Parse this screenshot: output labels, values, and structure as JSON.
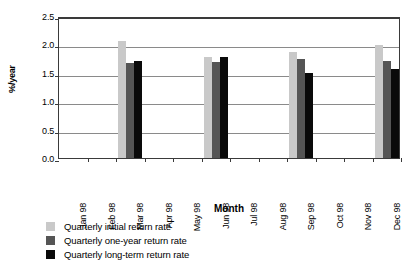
{
  "chart_data": {
    "type": "bar",
    "title": "",
    "xlabel": "Month",
    "ylabel": "%/year",
    "ylim": [
      0.0,
      2.5
    ],
    "ytick_values": [
      0.0,
      0.5,
      1.0,
      1.5,
      2.0,
      2.5
    ],
    "ytick_labels": [
      "0.0",
      "0.5",
      "1.0",
      "1.5",
      "2.0",
      "2.5"
    ],
    "grid": true,
    "legend_position": "below",
    "categories": [
      "Jan 98",
      "Feb 98",
      "Mar 98",
      "Apr 98",
      "May 98",
      "Jun 98",
      "Jul 98",
      "Aug 98",
      "Sep 98",
      "Oct 98",
      "Nov 98",
      "Dec 98"
    ],
    "series": [
      {
        "name": "Quarterly initial return rate",
        "color": "#c9c9c9",
        "values": [
          null,
          null,
          2.06,
          null,
          null,
          1.78,
          null,
          null,
          1.86,
          null,
          null,
          1.99
        ]
      },
      {
        "name": "Quarterly one-year return rate",
        "color": "#555555",
        "values": [
          null,
          null,
          1.67,
          null,
          null,
          1.69,
          null,
          null,
          1.74,
          null,
          null,
          1.7
        ]
      },
      {
        "name": "Quarterly long-term return rate",
        "color": "#0a0a0a",
        "values": [
          null,
          null,
          1.71,
          null,
          null,
          1.77,
          null,
          null,
          1.49,
          null,
          null,
          1.56
        ]
      }
    ]
  },
  "legend": {
    "items": [
      {
        "label": "Quarterly initial return rate",
        "color": "#c9c9c9"
      },
      {
        "label": "Quarterly one-year return rate",
        "color": "#555555"
      },
      {
        "label": "Quarterly long-term return rate",
        "color": "#0a0a0a"
      }
    ]
  },
  "axes": {
    "y_title": "%/year",
    "x_title": "Month"
  },
  "colors": {
    "frame": "#3a3a3a",
    "gridline": "#8a8a8a",
    "background": "#ffffff"
  }
}
